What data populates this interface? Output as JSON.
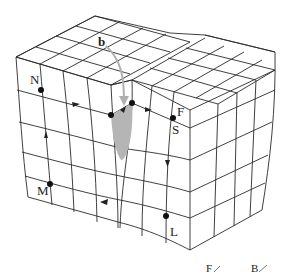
{
  "figure": {
    "type": "crystal lattice block with Burgers circuit around dislocation",
    "labels": {
      "burgers_vector": "b",
      "start": "S",
      "finish": "F",
      "corner_n": "N",
      "corner_m": "M",
      "corner_l": "L"
    },
    "legend": {
      "items": [
        {
          "label": "F",
          "mark": "⁄"
        },
        {
          "label": "B",
          "mark": "⁄"
        }
      ]
    },
    "colors": {
      "lines": "#2a2a2a",
      "dislocation_shading": "#b5b5b5",
      "burgers_arrow": "#b0b0b0",
      "dots": "#111111"
    }
  }
}
